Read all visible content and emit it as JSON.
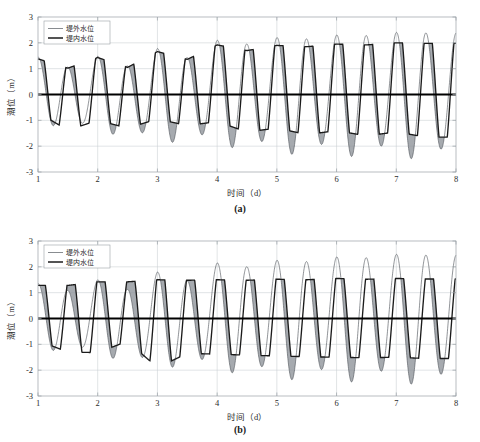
{
  "figure": {
    "background": "#ffffff",
    "width": 480,
    "height": 442
  },
  "colors": {
    "outer_curve": "#555a60",
    "inner_curve": "#1b1b1b",
    "band_fill": "#8d9298",
    "grid": "#c8cdd2",
    "frame": "#9aa0a6",
    "zero_line": "#000000",
    "text": "#2b2b2b"
  },
  "subplots": [
    {
      "id": "a",
      "caption": "(a)",
      "xlabel": "时间（d）",
      "ylabel": "潮位（m）",
      "legend": [
        {
          "label": "堤外水位",
          "style": "thin"
        },
        {
          "label": "堤内水位",
          "style": "thick"
        }
      ],
      "xticks": [
        "1",
        "2",
        "3",
        "4",
        "5",
        "6",
        "7",
        "8"
      ],
      "yticks": [
        "3",
        "2",
        "1",
        "0",
        "-1",
        "-2",
        "-3"
      ]
    },
    {
      "id": "b",
      "caption": "(b)",
      "xlabel": "时间（d）",
      "ylabel": "潮位（m）",
      "legend": [
        {
          "label": "堤外水位",
          "style": "thin"
        },
        {
          "label": "堤内水位",
          "style": "thick"
        }
      ],
      "xticks": [
        "1",
        "2",
        "3",
        "4",
        "5",
        "6",
        "7",
        "8"
      ],
      "yticks": [
        "3",
        "2",
        "1",
        "0",
        "-1",
        "-2",
        "-3"
      ]
    }
  ],
  "chart_data": {
    "type": "line",
    "title": "",
    "panels": [
      {
        "id": "a",
        "label": "(a)",
        "xlabel": "时间（d）",
        "ylabel": "潮位（m）",
        "xlim": [
          1,
          8
        ],
        "ylim": [
          -3,
          3
        ],
        "xticks": [
          1,
          2,
          3,
          4,
          5,
          6,
          7,
          8
        ],
        "yticks": [
          -3,
          -2,
          -1,
          0,
          1,
          2,
          3
        ],
        "grid": true,
        "legend_position": "upper-left",
        "series": [
          {
            "name": "堤外水位",
            "style": "thin-line",
            "description": "Sinusoidal tidal water level outside the dike, semi-diurnal period 0.5 d, amplitude growing from about 1.4 m to 2.4 m over the record (spring-neap modulation).",
            "period_days": 0.5,
            "amplitude_start": 1.4,
            "amplitude_end": 2.45,
            "mean_level": 0.05
          },
          {
            "name": "堤内水位",
            "style": "thick-line",
            "description": "Water level inside the dike; follows the outside tide but peaks are clipped to a flat plateau by the sluice/dike control, with slight lag. Plateau level about 1.0 to 2.0 m rising through the record.",
            "period_days": 0.5,
            "clipped": true,
            "plateau_start": 1.35,
            "plateau_end": 2.0,
            "trough_start": -0.7,
            "trough_end": -2.1
          }
        ],
        "shaded_band": {
          "description": "Gray shading between the two curves highlights the head difference (堤外 minus 堤内) during falling tide; band widens as tidal range increases.",
          "fill": "#8d9298"
        },
        "cycles": [
          {
            "t": 1.0,
            "outer_peak": 1.45,
            "inner_peak": 1.38,
            "outer_trough": -0.75,
            "inner_trough": -0.7
          },
          {
            "t": 1.5,
            "outer_peak": 1.05,
            "inner_peak": 1.02,
            "outer_trough": -1.42,
            "inner_trough": -1.38
          },
          {
            "t": 2.0,
            "outer_peak": 1.48,
            "inner_peak": 1.43,
            "outer_trough": -1.05,
            "inner_trough": -1.0
          },
          {
            "t": 2.5,
            "outer_peak": 1.1,
            "inner_peak": 1.05,
            "outer_trough": -1.75,
            "inner_trough": -1.3
          },
          {
            "t": 3.0,
            "outer_peak": 1.78,
            "inner_peak": 1.66,
            "outer_trough": -1.52,
            "inner_trough": -0.95
          },
          {
            "t": 3.5,
            "outer_peak": 1.42,
            "inner_peak": 1.36,
            "outer_trough": -1.85,
            "inner_trough": -1.2
          },
          {
            "t": 4.0,
            "outer_peak": 2.1,
            "inner_peak": 1.92,
            "outer_trough": -1.62,
            "inner_trough": -1.05
          },
          {
            "t": 4.5,
            "outer_peak": 1.95,
            "inner_peak": 1.7,
            "outer_trough": -2.1,
            "inner_trough": -1.45
          },
          {
            "t": 5.0,
            "outer_peak": 2.2,
            "inner_peak": 1.9,
            "outer_trough": -1.95,
            "inner_trough": -1.3
          },
          {
            "t": 5.5,
            "outer_peak": 2.15,
            "inner_peak": 1.85,
            "outer_trough": -2.25,
            "inner_trough": -1.55
          },
          {
            "t": 6.0,
            "outer_peak": 2.3,
            "inner_peak": 1.95,
            "outer_trough": -2.05,
            "inner_trough": -1.4
          },
          {
            "t": 6.5,
            "outer_peak": 2.28,
            "inner_peak": 1.92,
            "outer_trough": -2.3,
            "inner_trough": -1.6
          },
          {
            "t": 7.0,
            "outer_peak": 2.4,
            "inner_peak": 2.0,
            "outer_trough": -2.15,
            "inner_trough": -1.45
          },
          {
            "t": 7.5,
            "outer_peak": 2.38,
            "inner_peak": 1.98,
            "outer_trough": -2.35,
            "inner_trough": -1.65
          }
        ]
      },
      {
        "id": "b",
        "label": "(b)",
        "xlabel": "时间（d）",
        "ylabel": "潮位（m）",
        "xlim": [
          1,
          8
        ],
        "ylim": [
          -3,
          3
        ],
        "xticks": [
          1,
          2,
          3,
          4,
          5,
          6,
          7,
          8
        ],
        "yticks": [
          -3,
          -2,
          -1,
          0,
          1,
          2,
          3
        ],
        "grid": true,
        "legend_position": "upper-left",
        "series": [
          {
            "name": "堤外水位",
            "style": "thin-line",
            "description": "Same outside tidal signal as panel (a): semi-diurnal sinusoid with amplitude growing from about 1.4 m to 2.5 m.",
            "period_days": 0.5,
            "amplitude_start": 1.4,
            "amplitude_end": 2.5,
            "mean_level": 0.05
          },
          {
            "name": "堤内水位",
            "style": "thick-line",
            "description": "Inside water level with much stronger clipping than panel (a): long flat plateaus near 1.2 to 1.5 m at high water and near -0.8 to -1.9 m at low water, producing a square-wave-like trace.",
            "period_days": 0.5,
            "clipped": true,
            "plateau_start": 1.28,
            "plateau_end": 1.55,
            "trough_start": -0.85,
            "trough_end": -1.9
          }
        ],
        "shaded_band": {
          "description": "Gray shading between outside and inside levels; much wider than in panel (a) because the inside level is held flat, giving a larger head difference.",
          "fill": "#8d9298"
        },
        "cycles": [
          {
            "t": 1.0,
            "outer_peak": 1.35,
            "inner_peak": 1.28,
            "outer_trough": -0.78,
            "inner_trough": -0.85
          },
          {
            "t": 1.5,
            "outer_peak": 1.08,
            "inner_peak": 1.28,
            "outer_trough": -1.45,
            "inner_trough": -1.3
          },
          {
            "t": 2.0,
            "outer_peak": 1.5,
            "inner_peak": 1.42,
            "outer_trough": -1.02,
            "inner_trough": -1.32
          },
          {
            "t": 2.5,
            "outer_peak": 1.12,
            "inner_peak": 1.42,
            "outer_trough": -1.78,
            "inner_trough": -0.88
          },
          {
            "t": 3.0,
            "outer_peak": 1.8,
            "inner_peak": 1.5,
            "outer_trough": -1.55,
            "inner_trough": -1.9
          },
          {
            "t": 3.5,
            "outer_peak": 1.45,
            "inner_peak": 1.48,
            "outer_trough": -1.88,
            "inner_trough": -1.35
          },
          {
            "t": 4.0,
            "outer_peak": 2.15,
            "inner_peak": 1.5,
            "outer_trough": -1.65,
            "inner_trough": -1.38
          },
          {
            "t": 4.5,
            "outer_peak": 2.0,
            "inner_peak": 1.48,
            "outer_trough": -2.15,
            "inner_trough": -1.42
          },
          {
            "t": 5.0,
            "outer_peak": 2.25,
            "inner_peak": 1.52,
            "outer_trough": -2.0,
            "inner_trough": -1.45
          },
          {
            "t": 5.5,
            "outer_peak": 2.2,
            "inner_peak": 1.5,
            "outer_trough": -2.3,
            "inner_trough": -1.48
          },
          {
            "t": 6.0,
            "outer_peak": 2.38,
            "inner_peak": 1.55,
            "outer_trough": -2.1,
            "inner_trough": -1.5
          },
          {
            "t": 6.5,
            "outer_peak": 2.35,
            "inner_peak": 1.52,
            "outer_trough": -2.35,
            "inner_trough": -1.52
          },
          {
            "t": 7.0,
            "outer_peak": 2.48,
            "inner_peak": 1.55,
            "outer_trough": -2.2,
            "inner_trough": -1.5
          },
          {
            "t": 7.5,
            "outer_peak": 2.45,
            "inner_peak": 1.53,
            "outer_trough": -2.4,
            "inner_trough": -1.55
          }
        ]
      }
    ]
  }
}
